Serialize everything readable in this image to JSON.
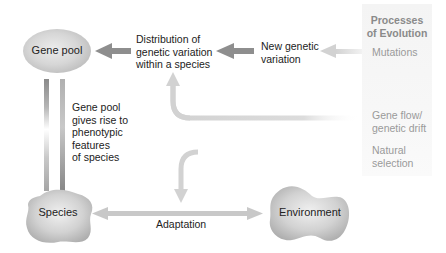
{
  "panel": {
    "title_line1": "Processes",
    "title_line2": "of Evolution",
    "items": [
      {
        "line1": "Mutations",
        "line2": ""
      },
      {
        "line1": "Gene flow/",
        "line2": "genetic drift"
      },
      {
        "line1": "Natural",
        "line2": "selection"
      }
    ]
  },
  "nodes": {
    "gene_pool": "Gene pool",
    "species": "Species",
    "environment": "Environment"
  },
  "labels": {
    "distribution": [
      "Distribution of",
      "genetic variation",
      "within a species"
    ],
    "new_variation": [
      "New genetic",
      "variation"
    ],
    "phenotypic": [
      "Gene pool",
      "gives rise to",
      "phenotypic",
      "features",
      "of species"
    ],
    "adaptation": "Adaptation"
  },
  "colors": {
    "arrow_dark": "#8c8c8c",
    "arrow_light": "#d0d0d0",
    "shape_fill": "#cfcfcf",
    "panel_bg": "#f5f5f5",
    "panel_text": "#9a9a9a"
  }
}
